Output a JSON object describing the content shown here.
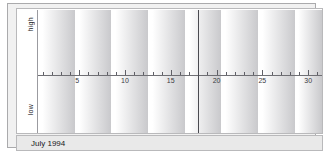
{
  "window": {
    "footer_label": "July 1994"
  },
  "axis": {
    "y_top_label": "high",
    "y_bottom_label": "low",
    "tick_labels": [
      "5",
      "10",
      "15",
      "20",
      "25",
      "30"
    ]
  },
  "colors": {
    "curve": "#55555c",
    "axis": "#6f6f74",
    "today_marker": "#4a4a50",
    "band_light": "#ffffff",
    "band_dark": "#c9c9cc",
    "frame": "#aaaaac",
    "footer_bg": "#e9e9e9",
    "panel_bg": "#ffffff"
  },
  "chart_data": {
    "type": "line",
    "title": "",
    "subtitle": "",
    "xlabel": "",
    "ylabel": "",
    "x": [
      1,
      2,
      3,
      4,
      5,
      6,
      7,
      8,
      9,
      10,
      11,
      12,
      13,
      14,
      15,
      16,
      17,
      18,
      19,
      20,
      21,
      22,
      23,
      24,
      25,
      26,
      27,
      28,
      29,
      30,
      31
    ],
    "xlim": [
      0.5,
      31.5
    ],
    "ylim": [
      -1,
      1
    ],
    "grid": false,
    "legend": "none",
    "today": 18,
    "tick_values": [
      5,
      10,
      15,
      20,
      25,
      30
    ],
    "y_axis_ticks": [
      {
        "value": 1,
        "label": "high"
      },
      {
        "value": -1,
        "label": "low"
      }
    ],
    "bands": [
      {
        "start": 0.5,
        "end": 4.5
      },
      {
        "start": 4.5,
        "end": 8.5
      },
      {
        "start": 8.5,
        "end": 12.5
      },
      {
        "start": 12.5,
        "end": 16.5
      },
      {
        "start": 16.5,
        "end": 20.5
      },
      {
        "start": 20.5,
        "end": 24.5
      },
      {
        "start": 24.5,
        "end": 28.5
      },
      {
        "start": 28.5,
        "end": 31.5
      }
    ],
    "series": [
      {
        "name": "physical",
        "period_days": 23,
        "phase_offset_days": 5.75,
        "values": [
          0.97,
          0.87,
          0.67,
          0.4,
          0.08,
          -0.27,
          -0.57,
          -0.8,
          -0.95,
          -1.0,
          -0.94,
          -0.79,
          -0.55,
          -0.24,
          0.11,
          0.44,
          0.71,
          0.9,
          0.99,
          0.97,
          0.84,
          0.62,
          0.34,
          0.01,
          -0.33,
          -0.62,
          -0.84,
          -0.97,
          -1.0,
          -0.92,
          -0.75
        ]
      },
      {
        "name": "emotional",
        "period_days": 28,
        "phase_offset_days": -3.0,
        "values": [
          0.62,
          0.78,
          0.9,
          0.97,
          1.0,
          0.97,
          0.9,
          0.78,
          0.62,
          0.43,
          0.22,
          0.0,
          -0.22,
          -0.43,
          -0.62,
          -0.78,
          -0.9,
          -0.97,
          -1.0,
          -0.97,
          -0.9,
          -0.78,
          -0.62,
          -0.43,
          -0.22,
          0.0,
          0.22,
          0.43,
          0.62,
          0.78,
          0.9
        ]
      },
      {
        "name": "intellectual",
        "period_days": 33,
        "phase_offset_days": 9.5,
        "values": [
          -0.86,
          -0.72,
          -0.55,
          -0.36,
          -0.16,
          0.06,
          0.27,
          0.46,
          0.64,
          0.79,
          0.91,
          0.98,
          1.0,
          0.98,
          0.91,
          0.79,
          0.64,
          0.46,
          0.27,
          0.06,
          -0.16,
          -0.36,
          -0.55,
          -0.72,
          -0.86,
          -0.95,
          -1.0,
          -0.99,
          -0.93,
          -0.83,
          -0.68
        ]
      }
    ]
  }
}
